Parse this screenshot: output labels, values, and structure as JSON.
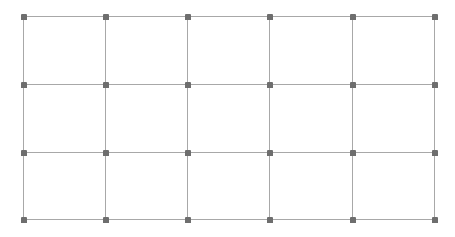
{
  "grid": {
    "columns_x": [
      23,
      105,
      187,
      269,
      352,
      434
    ],
    "rows_y": [
      16,
      84,
      152,
      219
    ],
    "line_color": "#a8a8a8",
    "node_color": "#6e6e6e",
    "background": "#ffffff",
    "cells": {
      "cols": 5,
      "rows": 3
    }
  }
}
